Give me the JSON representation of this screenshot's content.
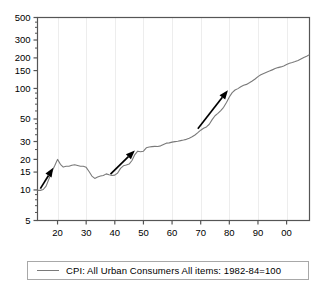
{
  "chart_data": {
    "type": "line",
    "title": "",
    "xlabel": "",
    "ylabel": "",
    "yscale": "log",
    "ylim": [
      5,
      500
    ],
    "xlim": [
      1913,
      2008
    ],
    "grid": "vertical-only-faint",
    "legend_position": "below-plot",
    "y_ticks": [
      5,
      10,
      15,
      20,
      30,
      50,
      100,
      150,
      200,
      300,
      500
    ],
    "y_tick_labels": [
      "5",
      "10",
      "15",
      "20",
      "30",
      "50",
      "100",
      "150",
      "200",
      "300",
      "500"
    ],
    "x_ticks": [
      1920,
      1930,
      1940,
      1950,
      1960,
      1970,
      1980,
      1990,
      2000
    ],
    "x_tick_labels": [
      "20",
      "30",
      "40",
      "50",
      "60",
      "70",
      "80",
      "90",
      "00"
    ],
    "series": [
      {
        "name": "CPI: All Urban Consumers  All items: 1982-84=100",
        "color": "#7a7a7a",
        "x": [
          1913,
          1914,
          1915,
          1916,
          1917,
          1918,
          1919,
          1920,
          1921,
          1922,
          1923,
          1924,
          1925,
          1926,
          1927,
          1928,
          1929,
          1930,
          1931,
          1932,
          1933,
          1934,
          1935,
          1936,
          1937,
          1938,
          1939,
          1940,
          1941,
          1942,
          1943,
          1944,
          1945,
          1946,
          1947,
          1948,
          1949,
          1950,
          1951,
          1952,
          1953,
          1954,
          1955,
          1956,
          1957,
          1958,
          1959,
          1960,
          1961,
          1962,
          1963,
          1964,
          1965,
          1966,
          1967,
          1968,
          1969,
          1970,
          1971,
          1972,
          1973,
          1974,
          1975,
          1976,
          1977,
          1978,
          1979,
          1980,
          1981,
          1982,
          1983,
          1984,
          1985,
          1986,
          1987,
          1988,
          1989,
          1990,
          1991,
          1992,
          1993,
          1994,
          1995,
          1996,
          1997,
          1998,
          1999,
          2000,
          2001,
          2002,
          2003,
          2004,
          2005,
          2006,
          2007,
          2008
        ],
        "y": [
          9.9,
          9.9,
          10.1,
          10.9,
          12.8,
          15.1,
          17.3,
          20.0,
          17.9,
          16.8,
          17.1,
          17.1,
          17.5,
          17.7,
          17.4,
          17.1,
          17.1,
          16.7,
          15.2,
          13.7,
          13.0,
          13.4,
          13.7,
          13.9,
          14.4,
          14.1,
          13.9,
          14.0,
          14.7,
          16.3,
          17.3,
          17.6,
          18.0,
          19.5,
          22.3,
          24.1,
          23.8,
          24.1,
          26.0,
          26.5,
          26.7,
          26.9,
          26.8,
          27.2,
          28.1,
          28.9,
          29.1,
          29.6,
          29.9,
          30.2,
          30.6,
          31.0,
          31.5,
          32.4,
          33.4,
          34.8,
          36.7,
          38.8,
          40.5,
          41.8,
          44.4,
          49.3,
          53.8,
          56.9,
          60.6,
          65.2,
          72.6,
          82.4,
          90.9,
          96.5,
          99.6,
          103.9,
          107.6,
          109.6,
          113.6,
          118.3,
          124.0,
          130.7,
          136.2,
          140.3,
          144.5,
          148.2,
          152.4,
          156.9,
          160.5,
          163.0,
          166.6,
          172.2,
          177.1,
          179.9,
          184.0,
          188.9,
          195.3,
          201.6,
          207.3,
          215.3
        ]
      }
    ],
    "annotations": [
      {
        "name": "arrow-1913-1920",
        "type": "arrow",
        "x1": 1914.0,
        "y1": 10.3,
        "x2": 1918.5,
        "y2": 16.5
      },
      {
        "name": "arrow-1940-1948",
        "type": "arrow",
        "x1": 1938.5,
        "y1": 14.3,
        "x2": 1947.0,
        "y2": 24.5
      },
      {
        "name": "arrow-1968-1981",
        "type": "arrow",
        "x1": 1969.0,
        "y1": 40.0,
        "x2": 1979.5,
        "y2": 96.0
      }
    ]
  },
  "legend": {
    "entry_label": "CPI: All Urban Consumers  All items: 1982-84=100",
    "line_color": "#7a7a7a"
  },
  "axes": {
    "frame_color": "#555555",
    "gridline_color": "#ededed"
  }
}
